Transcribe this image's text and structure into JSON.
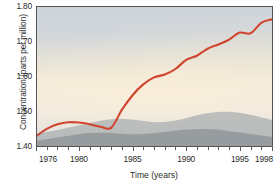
{
  "chart_data": {
    "type": "line",
    "title": "",
    "xlabel": "Time (years)",
    "ylabel": "Concentration (parts per million)",
    "xlim": [
      1976,
      1998
    ],
    "ylim": [
      1.4,
      1.8
    ],
    "grid": false,
    "legend": null,
    "xticks": [
      1976,
      1977,
      1978,
      1979,
      1980,
      1981,
      1982,
      1983,
      1984,
      1985,
      1986,
      1987,
      1988,
      1989,
      1990,
      1991,
      1992,
      1993,
      1994,
      1995,
      1996,
      1997,
      1998
    ],
    "xtick_labels": [
      {
        "value": 1976,
        "label": "1976"
      },
      {
        "value": 1980,
        "label": "1980"
      },
      {
        "value": 1985,
        "label": "1985"
      },
      {
        "value": 1990,
        "label": "1990"
      },
      {
        "value": 1995,
        "label": "1995"
      },
      {
        "value": 1998,
        "label": "1998"
      }
    ],
    "yticks": [
      1.4,
      1.5,
      1.6,
      1.7,
      1.8
    ],
    "ytick_labels": [
      "1.40",
      "1.50",
      "1.60",
      "1.70",
      "1.80"
    ],
    "series": [
      {
        "name": "Methane concentration",
        "color": "#d1452e",
        "x": [
          1976,
          1977,
          1978,
          1979,
          1980,
          1981,
          1982,
          1983,
          1984,
          1985,
          1986,
          1987,
          1988,
          1989,
          1990,
          1991,
          1992,
          1993,
          1994,
          1995,
          1996,
          1997,
          1998
        ],
        "values": [
          1.428,
          1.449,
          1.462,
          1.468,
          1.467,
          1.462,
          1.455,
          1.452,
          1.503,
          1.545,
          1.576,
          1.596,
          1.604,
          1.62,
          1.646,
          1.658,
          1.678,
          1.69,
          1.704,
          1.724,
          1.722,
          1.752,
          1.762
        ]
      }
    ],
    "annotations": []
  },
  "figure": {
    "background_description": "photographic haze and distant mountain ridge behind the plot area",
    "ridge_color": "#9ea6a8",
    "sky_top_color": "#ccd2d9",
    "sky_mid_color": "#f2ebdd",
    "axis_color": "#555555"
  }
}
